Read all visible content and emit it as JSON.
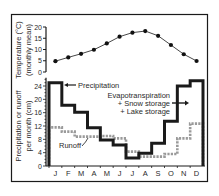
{
  "chart_data": [
    {
      "type": "line",
      "title": "",
      "ylabel": "Temperature (°C) (monthly mean)",
      "ylabel_lines": [
        "Temperature (°C)",
        "(monthly mean)"
      ],
      "categories": [
        "J",
        "F",
        "M",
        "A",
        "M",
        "J",
        "J",
        "A",
        "S",
        "O",
        "N",
        "D"
      ],
      "series": [
        {
          "name": "Temperature",
          "values": [
            4.8,
            6.5,
            8.1,
            9.9,
            12.7,
            15.7,
            17.5,
            18.2,
            16.1,
            12.0,
            7.9,
            4.9
          ]
        }
      ],
      "yticks": [
        0,
        5,
        10,
        15,
        20
      ],
      "ylim": [
        0,
        20
      ],
      "grid": false,
      "marker": "circle"
    },
    {
      "type": "line",
      "step": true,
      "title": "",
      "xlabel": "",
      "ylabel": "Precipitation or runoff per month (cm)",
      "ylabel_lines": [
        "Precipitation or runoff",
        "per month (cm)"
      ],
      "categories": [
        "J",
        "F",
        "M",
        "A",
        "M",
        "J",
        "J",
        "A",
        "S",
        "O",
        "N",
        "D"
      ],
      "series": [
        {
          "name": "Precipitation",
          "style": "solid",
          "color": "#1a1a1a",
          "values": [
            25,
            18.2,
            16.1,
            11.5,
            7.8,
            6.3,
            2.4,
            3.8,
            6.8,
            13.4,
            24,
            25.6
          ]
        },
        {
          "name": "Runoff",
          "style": "dotted",
          "color": "#9a9a9a",
          "values": [
            11.6,
            10.3,
            8.8,
            8.8,
            9.0,
            8.3,
            4.3,
            2.8,
            2.8,
            3.6,
            8.3,
            12.7
          ]
        }
      ],
      "yticks": [
        0,
        4,
        8,
        12,
        16,
        20,
        24
      ],
      "ylim": [
        0,
        26
      ],
      "grid": false,
      "annotations": [
        {
          "text": "Precipitation",
          "target": "Precipitation"
        },
        {
          "text": "Runoff",
          "target": "Runoff"
        },
        {
          "text_lines": [
            "Evapotranspiration",
            "+ Snow storage",
            "+ Lake storage"
          ],
          "target": "area between precipitation and runoff"
        }
      ]
    }
  ]
}
